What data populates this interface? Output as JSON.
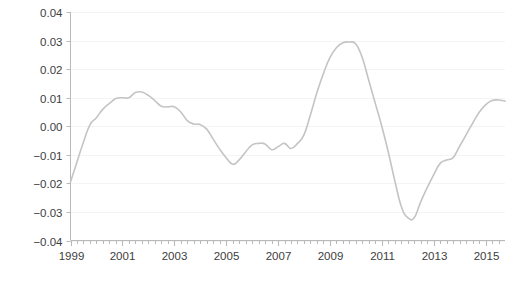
{
  "chart_data": {
    "type": "line",
    "title": "",
    "subtitle": "",
    "xlabel": "",
    "ylabel": "Proportionate deviation from trend",
    "xlim": [
      1999.0,
      2015.75
    ],
    "ylim": [
      -0.04,
      0.04
    ],
    "grid": true,
    "grid_axis": "y",
    "legend": "none",
    "y_ticks": [
      0.04,
      0.03,
      0.02,
      0.01,
      0.0,
      -0.01,
      -0.02,
      -0.03,
      -0.04
    ],
    "y_tick_labels": [
      "0.04",
      "0.03",
      "0.02",
      "0.01",
      "0.00",
      "−0.01",
      "−0.02",
      "−0.03",
      "−0.04"
    ],
    "x_ticks": [
      1999,
      2001,
      2003,
      2005,
      2007,
      2009,
      2011,
      2013,
      2015
    ],
    "x_tick_labels": [
      "1999",
      "2001",
      "2003",
      "2005",
      "2007",
      "2009",
      "2011",
      "2013",
      "2015"
    ],
    "x_minor_tick_interval": 0.25,
    "line_color": "#c4c4c4",
    "line_width": 1.6,
    "gridline_color": "#f4f4f4",
    "axis_color": "#b9b9b9",
    "background_color": "#ffffff",
    "series": [
      {
        "name": "Proportionate deviation from trend",
        "x": [
          1999.0,
          1999.25,
          1999.5,
          1999.75,
          2000.0,
          2000.25,
          2000.5,
          2000.75,
          2001.0,
          2001.25,
          2001.5,
          2001.75,
          2002.0,
          2002.25,
          2002.5,
          2002.75,
          2003.0,
          2003.25,
          2003.5,
          2003.75,
          2004.0,
          2004.25,
          2004.5,
          2004.75,
          2005.0,
          2005.25,
          2005.5,
          2005.75,
          2006.0,
          2006.25,
          2006.5,
          2006.75,
          2007.0,
          2007.25,
          2007.5,
          2007.75,
          2008.0,
          2008.25,
          2008.5,
          2008.75,
          2009.0,
          2009.25,
          2009.5,
          2009.75,
          2010.0,
          2010.25,
          2010.5,
          2010.75,
          2011.0,
          2011.25,
          2011.5,
          2011.75,
          2012.0,
          2012.25,
          2012.5,
          2012.75,
          2013.0,
          2013.25,
          2013.5,
          2013.75,
          2014.0,
          2014.25,
          2014.5,
          2014.75,
          2015.0,
          2015.25,
          2015.5,
          2015.75
        ],
        "y": [
          -0.0195,
          -0.0125,
          -0.0055,
          0.0005,
          0.003,
          0.006,
          0.008,
          0.0097,
          0.01,
          0.01,
          0.0118,
          0.012,
          0.0108,
          0.009,
          0.007,
          0.0068,
          0.0068,
          0.005,
          0.002,
          0.0008,
          0.0006,
          -0.001,
          -0.0045,
          -0.008,
          -0.011,
          -0.0133,
          -0.0118,
          -0.009,
          -0.0065,
          -0.006,
          -0.0062,
          -0.0082,
          -0.0072,
          -0.006,
          -0.0078,
          -0.006,
          -0.003,
          0.004,
          0.0118,
          0.0185,
          0.024,
          0.0275,
          0.0292,
          0.0295,
          0.0288,
          0.024,
          0.016,
          0.008,
          0.0,
          -0.009,
          -0.019,
          -0.028,
          -0.032,
          -0.032,
          -0.0265,
          -0.0215,
          -0.017,
          -0.013,
          -0.0118,
          -0.011,
          -0.007,
          -0.003,
          0.001,
          0.0048,
          0.0075,
          0.009,
          0.0092,
          0.0088
        ]
      }
    ],
    "annotations": [
      {
        "label": "trough-1999Q1",
        "x": 1999.0,
        "y": -0.0195
      },
      {
        "label": "peak-2001Q4",
        "x": 2001.75,
        "y": 0.012
      },
      {
        "label": "trough-2004Q2",
        "x": 2004.25,
        "y": -0.0133
      },
      {
        "label": "peak-2008Q4",
        "x": 2008.75,
        "y": 0.0295
      },
      {
        "label": "trough-2009-crash",
        "x": 2009.75,
        "y": -0.032
      },
      {
        "label": "peak-2011",
        "x": 2011.25,
        "y": 0.0092
      },
      {
        "label": "trough-2013",
        "x": 2013.0,
        "y": -0.0092
      },
      {
        "label": "end-2015",
        "x": 2015.75,
        "y": 0.0088
      }
    ]
  },
  "extra_points": {
    "recovery_kink_x": 2010.5,
    "recovery_kink_y": -0.012,
    "plateau_2009_start": 2009.75,
    "plateau_2009_end": 2010.1,
    "trough_2013_flat_start": 2013.0,
    "trough_2013_flat_end": 2013.4
  }
}
